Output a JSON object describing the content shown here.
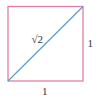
{
  "diagram": {
    "shape": "unit-square",
    "square": {
      "x1": 8,
      "y1": 6.5,
      "x2": 83,
      "y2": 81,
      "stroke": "#e07fa3"
    },
    "diagonal": {
      "from": "bottom-left",
      "to": "top-right",
      "stroke": "#5b9bd5"
    },
    "labels": {
      "diagonal": "√2",
      "right_side": "1",
      "bottom_side": "1"
    }
  }
}
